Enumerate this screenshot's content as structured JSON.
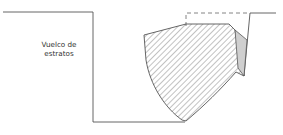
{
  "diagram": {
    "label_line1": "Vuelco de",
    "label_line2": "estratos",
    "colors": {
      "line": "#555555",
      "hatch": "#777777",
      "wedge_fill": "#cfcfcf",
      "background": "#ffffff"
    }
  }
}
